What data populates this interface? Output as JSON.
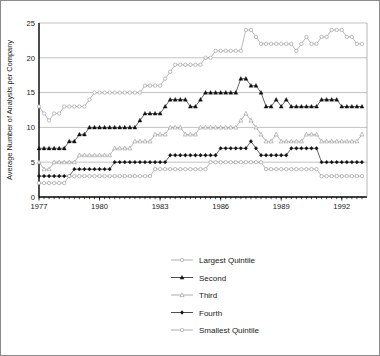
{
  "chart_data": {
    "type": "line",
    "title": "",
    "xlabel": "",
    "ylabel": "Average Number of Analysts per Company",
    "ylim": [
      0,
      25
    ],
    "yticks": [
      0,
      5,
      10,
      15,
      20,
      25
    ],
    "xlim": [
      1977.0,
      1993.25
    ],
    "xticks": [
      1977,
      1980,
      1983,
      1986,
      1989,
      1992
    ],
    "xtick_labels": [
      "1977",
      "1980",
      "1983",
      "1986",
      "1989",
      "1992"
    ],
    "grid": "horizontal",
    "legend_position": "below-plot-center",
    "x_step": 0.25,
    "x": [
      1977.0,
      1977.25,
      1977.5,
      1977.75,
      1978.0,
      1978.25,
      1978.5,
      1978.75,
      1979.0,
      1979.25,
      1979.5,
      1979.75,
      1980.0,
      1980.25,
      1980.5,
      1980.75,
      1981.0,
      1981.25,
      1981.5,
      1981.75,
      1982.0,
      1982.25,
      1982.5,
      1982.75,
      1983.0,
      1983.25,
      1983.5,
      1983.75,
      1984.0,
      1984.25,
      1984.5,
      1984.75,
      1985.0,
      1985.25,
      1985.5,
      1985.75,
      1986.0,
      1986.25,
      1986.5,
      1986.75,
      1987.0,
      1987.25,
      1987.5,
      1987.75,
      1988.0,
      1988.25,
      1988.5,
      1988.75,
      1989.0,
      1989.25,
      1989.5,
      1989.75,
      1990.0,
      1990.25,
      1990.5,
      1990.75,
      1991.0,
      1991.25,
      1991.5,
      1991.75,
      1992.0,
      1992.25,
      1992.5,
      1992.75,
      1993.0
    ],
    "series": [
      {
        "name": "Largest Quintile",
        "marker": "open-circle",
        "values": [
          13,
          12,
          11,
          12,
          12,
          13,
          13,
          13,
          13,
          13,
          14,
          15,
          15,
          15,
          15,
          15,
          15,
          15,
          15,
          15,
          15,
          16,
          16,
          16,
          16,
          17,
          18,
          19,
          19,
          19,
          19,
          19,
          19,
          20,
          20,
          21,
          21,
          21,
          21,
          21,
          21,
          24,
          24,
          23,
          22,
          22,
          22,
          22,
          22,
          22,
          22,
          21,
          22,
          23,
          22,
          22,
          23,
          23,
          24,
          24,
          24,
          23,
          23,
          22,
          22
        ]
      },
      {
        "name": "Second",
        "marker": "filled-triangle",
        "values": [
          7,
          7,
          7,
          7,
          7,
          7,
          8,
          8,
          9,
          9,
          10,
          10,
          10,
          10,
          10,
          10,
          10,
          10,
          10,
          10,
          11,
          12,
          12,
          12,
          12,
          13,
          14,
          14,
          14,
          14,
          13,
          13,
          14,
          15,
          15,
          15,
          15,
          15,
          15,
          15,
          17,
          17,
          16,
          16,
          15,
          13,
          13,
          14,
          13,
          14,
          13,
          13,
          13,
          13,
          13,
          13,
          14,
          14,
          14,
          14,
          13,
          13,
          13,
          13,
          13
        ]
      },
      {
        "name": "Third",
        "marker": "open-triangle",
        "values": [
          5,
          4,
          4,
          5,
          5,
          5,
          5,
          5,
          6,
          6,
          6,
          6,
          6,
          6,
          6,
          7,
          7,
          7,
          7,
          8,
          8,
          8,
          8,
          9,
          9,
          9,
          10,
          10,
          10,
          9,
          9,
          9,
          10,
          10,
          10,
          10,
          10,
          10,
          10,
          10,
          11,
          12,
          11,
          10,
          9,
          8,
          8,
          9,
          8,
          8,
          8,
          8,
          8,
          9,
          9,
          9,
          8,
          8,
          8,
          8,
          8,
          8,
          8,
          8,
          9
        ]
      },
      {
        "name": "Fourth",
        "marker": "filled-diamond",
        "values": [
          3,
          3,
          3,
          3,
          3,
          3,
          3,
          4,
          4,
          4,
          4,
          4,
          4,
          4,
          4,
          5,
          5,
          5,
          5,
          5,
          5,
          5,
          5,
          5,
          5,
          5,
          6,
          6,
          6,
          6,
          6,
          6,
          6,
          6,
          6,
          6,
          7,
          7,
          7,
          7,
          7,
          7,
          8,
          7,
          6,
          6,
          6,
          6,
          6,
          6,
          7,
          7,
          7,
          7,
          7,
          7,
          5,
          5,
          5,
          5,
          5,
          5,
          5,
          5,
          5
        ]
      },
      {
        "name": "Smallest Quintile",
        "marker": "open-circle",
        "values": [
          2,
          2,
          2,
          2,
          2,
          2,
          3,
          3,
          3,
          3,
          3,
          3,
          3,
          3,
          3,
          3,
          3,
          3,
          3,
          3,
          3,
          3,
          3,
          4,
          4,
          4,
          4,
          4,
          4,
          4,
          4,
          4,
          4,
          4,
          5,
          5,
          5,
          5,
          5,
          5,
          5,
          5,
          5,
          5,
          5,
          4,
          4,
          4,
          4,
          4,
          4,
          4,
          4,
          4,
          4,
          4,
          3,
          3,
          3,
          3,
          3,
          3,
          3,
          3,
          3
        ]
      }
    ]
  },
  "legend": {
    "items": [
      {
        "label": "Largest Quintile",
        "marker": "open-circle"
      },
      {
        "label": "Second",
        "marker": "filled-triangle"
      },
      {
        "label": "Third",
        "marker": "open-triangle"
      },
      {
        "label": "Fourth",
        "marker": "filled-diamond"
      },
      {
        "label": "Smallest Quintile",
        "marker": "open-circle"
      }
    ]
  }
}
